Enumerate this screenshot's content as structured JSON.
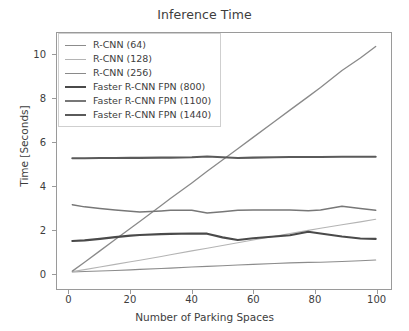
{
  "chart_data": {
    "type": "line",
    "title": "Inference Time",
    "xlabel": "Number of Parking Spaces",
    "ylabel": "Time [Seconds]",
    "xlim": [
      -4,
      105
    ],
    "ylim": [
      -0.75,
      11.0
    ],
    "xticks": [
      0,
      20,
      40,
      60,
      80,
      100
    ],
    "yticks": [
      0,
      2,
      4,
      6,
      8,
      10
    ],
    "grid": false,
    "legend_position": "upper left",
    "x": [
      1,
      5,
      10,
      15,
      20,
      23,
      30,
      33,
      40,
      45,
      50,
      55,
      60,
      67,
      72,
      78,
      82,
      89,
      95,
      100
    ],
    "series": [
      {
        "name": "R-CNN (64)",
        "color": "#8c8c8c",
        "width": 1.1,
        "values": [
          0.03,
          0.05,
          0.08,
          0.1,
          0.13,
          0.15,
          0.19,
          0.21,
          0.26,
          0.29,
          0.32,
          0.35,
          0.38,
          0.42,
          0.45,
          0.47,
          0.48,
          0.51,
          0.55,
          0.58
        ]
      },
      {
        "name": "R-CNN (128)",
        "color": "#b4b4b4",
        "width": 1.1,
        "values": [
          0.05,
          0.14,
          0.26,
          0.38,
          0.5,
          0.57,
          0.74,
          0.82,
          1.0,
          1.12,
          1.25,
          1.37,
          1.5,
          1.67,
          1.8,
          1.94,
          2.04,
          2.2,
          2.33,
          2.45
        ]
      },
      {
        "name": "R-CNN (256)",
        "color": "#8a8a8a",
        "width": 1.3,
        "values": [
          0.07,
          0.48,
          1.0,
          1.52,
          2.04,
          2.35,
          3.08,
          3.4,
          4.12,
          4.65,
          5.17,
          5.69,
          6.21,
          6.94,
          7.46,
          8.08,
          8.5,
          9.28,
          9.85,
          10.38
        ]
      },
      {
        "name": "Faster R-CNN FPN (800)",
        "color": "#4a4a4a",
        "width": 2.1,
        "values": [
          1.45,
          1.48,
          1.55,
          1.63,
          1.7,
          1.73,
          1.77,
          1.78,
          1.8,
          1.79,
          1.62,
          1.5,
          1.58,
          1.66,
          1.72,
          1.88,
          1.8,
          1.66,
          1.57,
          1.55
        ]
      },
      {
        "name": "Faster R-CNN FPN (1100)",
        "color": "#777777",
        "width": 1.5,
        "values": [
          3.12,
          3.02,
          2.95,
          2.88,
          2.82,
          2.78,
          2.83,
          2.86,
          2.86,
          2.74,
          2.8,
          2.86,
          2.88,
          2.88,
          2.88,
          2.84,
          2.88,
          3.05,
          2.95,
          2.86
        ]
      },
      {
        "name": "Faster R-CNN FPN (1440)",
        "color": "#5a5a5a",
        "width": 2.1,
        "values": [
          5.25,
          5.25,
          5.26,
          5.26,
          5.27,
          5.27,
          5.28,
          5.28,
          5.3,
          5.33,
          5.3,
          5.26,
          5.28,
          5.3,
          5.31,
          5.31,
          5.31,
          5.32,
          5.32,
          5.32
        ]
      }
    ]
  },
  "axes": {
    "ytick_labels": [
      "0",
      "2",
      "4",
      "6",
      "8",
      "10"
    ],
    "xtick_labels": [
      "0",
      "20",
      "40",
      "60",
      "80",
      "100"
    ]
  }
}
